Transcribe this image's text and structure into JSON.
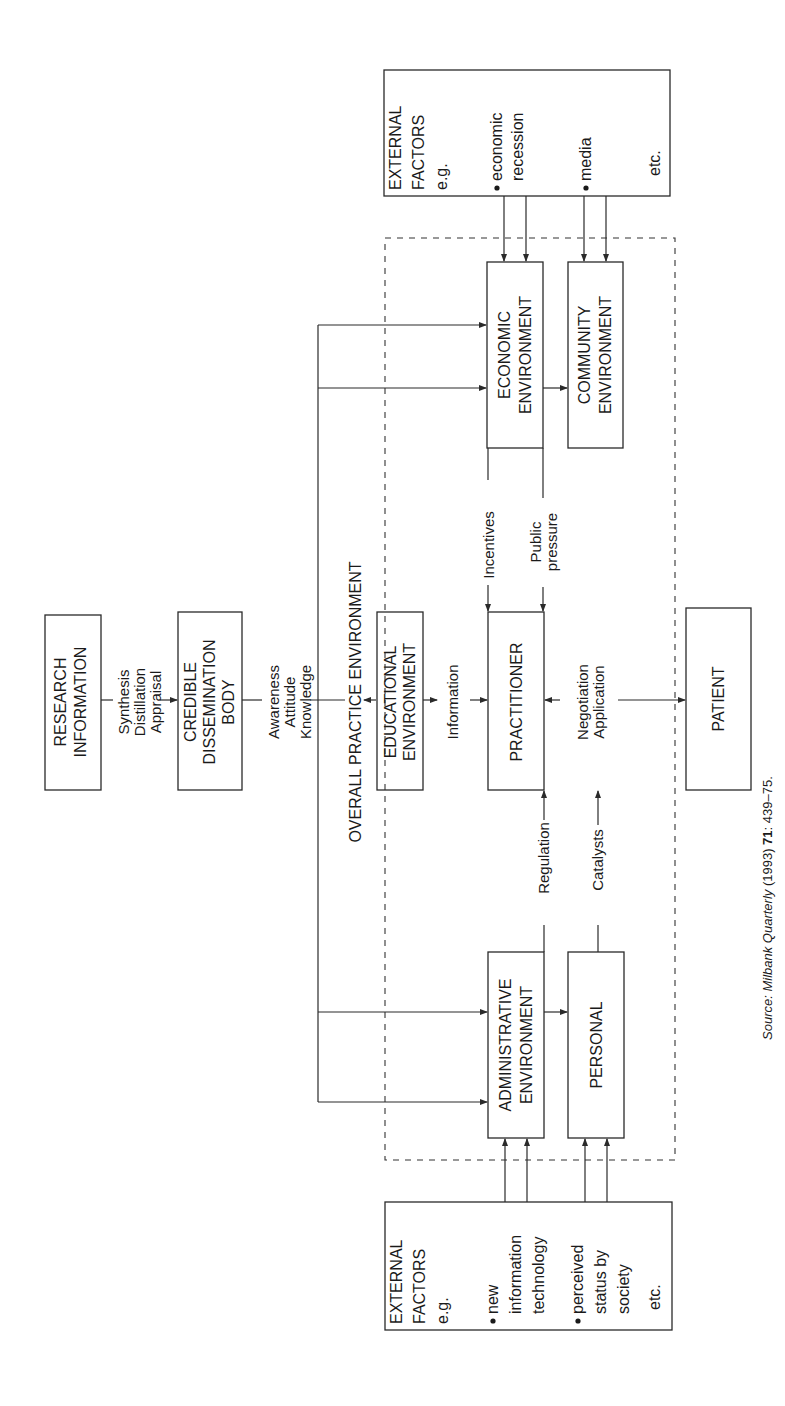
{
  "diagram": {
    "orientation": "rotated-90-ccw",
    "nodes": {
      "research": {
        "lines": [
          "RESEARCH",
          "INFORMATION"
        ]
      },
      "credible": {
        "lines": [
          "CREDIBLE",
          "DISSEMINATION",
          "BODY"
        ]
      },
      "educational": {
        "lines": [
          "EDUCATIONAL",
          "ENVIRONMENT"
        ]
      },
      "practitioner": {
        "lines": [
          "PRACTITIONER"
        ]
      },
      "patient": {
        "lines": [
          "PATIENT"
        ]
      },
      "economic": {
        "lines": [
          "ECONOMIC",
          "ENVIRONMENT"
        ]
      },
      "community": {
        "lines": [
          "COMMUNITY",
          "ENVIRONMENT"
        ]
      },
      "administrative": {
        "lines": [
          "ADMINISTRATIVE",
          "ENVIRONMENT"
        ]
      },
      "personal": {
        "lines": [
          "PERSONAL"
        ]
      },
      "external_top": {
        "lines": [
          "EXTERNAL",
          "FACTORS",
          "e.g."
        ],
        "bullets": [
          {
            "lines": [
              "economic",
              "recession"
            ]
          },
          {
            "lines": [
              "media"
            ]
          }
        ],
        "etc": "etc."
      },
      "external_bottom": {
        "lines": [
          "EXTERNAL",
          "FACTORS",
          "e.g."
        ],
        "bullets": [
          {
            "lines": [
              "new",
              "information",
              "technology"
            ]
          },
          {
            "lines": [
              "perceived",
              "status by",
              "society"
            ]
          }
        ],
        "etc": "etc."
      }
    },
    "container_label": "OVERALL PRACTICE ENVIRONMENT",
    "edge_labels": {
      "research_to_credible": [
        "Synthesis",
        "Distillation",
        "Appraisal"
      ],
      "credible_to_environment": [
        "Awareness",
        "Attitude",
        "Knowledge"
      ],
      "educational_to_practitioner": "Information",
      "economic_to_practitioner": "Incentives",
      "community_to_practitioner": [
        "Public",
        "pressure"
      ],
      "administrative_to_practitioner": "Regulation",
      "personal_to_practitioner": "Catalysts",
      "practitioner_patient": [
        "Negotiation",
        "Application"
      ]
    },
    "source": {
      "prefix": "Source: ",
      "journal": "Milbank Quarterly",
      "year": " (1993) ",
      "volume": "71",
      "pages": ": 439–75."
    }
  }
}
